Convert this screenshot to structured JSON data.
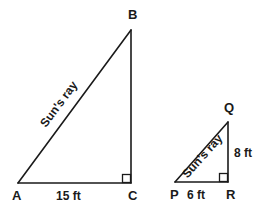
{
  "diagram": {
    "type": "similar-right-triangles",
    "background_color": "#ffffff",
    "stroke_color": "#1a1a1a",
    "text_color": "#1a1a1a",
    "width": 264,
    "height": 214,
    "large_triangle": {
      "name": "triangle-ABC",
      "vertices": {
        "A": {
          "label": "A",
          "x": 18,
          "y": 183
        },
        "B": {
          "label": "B",
          "x": 131,
          "y": 30
        },
        "C": {
          "label": "C",
          "x": 131,
          "y": 183
        }
      },
      "hypotenuse_label": "Sun's ray",
      "base_label": "15 ft",
      "right_angle_at": "C",
      "right_angle_marker": "square"
    },
    "small_triangle": {
      "name": "triangle-PQR",
      "vertices": {
        "P": {
          "label": "P",
          "x": 175,
          "y": 182
        },
        "Q": {
          "label": "Q",
          "x": 228,
          "y": 122
        },
        "R": {
          "label": "R",
          "x": 228,
          "y": 182
        }
      },
      "hypotenuse_label": "Sun's ray",
      "base_label": "6 ft",
      "height_label": "8 ft",
      "right_angle_at": "R",
      "right_angle_marker": "square"
    }
  }
}
